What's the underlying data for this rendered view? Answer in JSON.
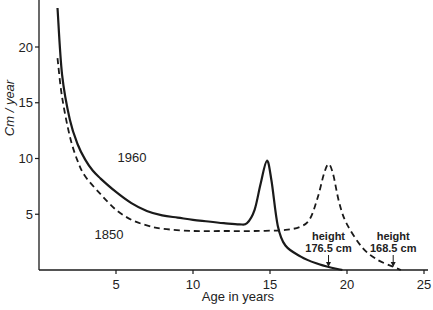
{
  "chart_data": {
    "type": "line",
    "title": "",
    "xlabel": "Age in years",
    "ylabel": "Cm / year",
    "xlim": [
      0,
      25
    ],
    "ylim": [
      0,
      23
    ],
    "xticks": [
      5,
      10,
      15,
      20,
      25
    ],
    "yticks": [
      5,
      10,
      15,
      20
    ],
    "grid": false,
    "legend": "inline labels",
    "series": [
      {
        "name": "1960",
        "style": "solid",
        "x": [
          1.2,
          1.5,
          2,
          2.5,
          3,
          3.5,
          4,
          5,
          6,
          7,
          8,
          9,
          10,
          11,
          12,
          13,
          13.5,
          14,
          14.4,
          14.8,
          15.1,
          15.5,
          16,
          17,
          18,
          19,
          19.7
        ],
        "values": [
          23.5,
          17.5,
          13.5,
          11.3,
          9.9,
          8.9,
          8.2,
          7.0,
          6.0,
          5.3,
          4.9,
          4.7,
          4.5,
          4.35,
          4.2,
          4.1,
          4.2,
          5.4,
          7.8,
          9.8,
          8.0,
          4.0,
          2.2,
          1.2,
          0.6,
          0.2,
          0.0
        ]
      },
      {
        "name": "1850",
        "style": "dashed",
        "x": [
          1.2,
          1.5,
          2,
          2.5,
          3,
          4,
          5,
          6,
          7,
          8,
          10,
          12,
          14,
          16,
          17,
          17.6,
          18.1,
          18.5,
          18.8,
          19.1,
          19.5,
          20,
          21,
          22,
          23,
          23.5
        ],
        "values": [
          19.0,
          15.5,
          12.0,
          9.8,
          8.4,
          6.8,
          5.4,
          4.5,
          4.0,
          3.7,
          3.5,
          3.5,
          3.5,
          3.6,
          3.9,
          4.6,
          6.5,
          8.6,
          9.5,
          8.6,
          6.0,
          4.1,
          2.0,
          0.9,
          0.3,
          0.0
        ]
      }
    ],
    "annotations": [
      {
        "text_line1": "height",
        "text_line2": "176.5 cm",
        "x": 18.8,
        "series": "1960"
      },
      {
        "text_line1": "height",
        "text_line2": "168.5 cm",
        "x": 23.0,
        "series": "1850"
      }
    ],
    "series_labels": [
      {
        "text": "1960",
        "x": 5.1,
        "y": 9.7
      },
      {
        "text": "1850",
        "x": 3.6,
        "y": 5.5
      }
    ]
  }
}
